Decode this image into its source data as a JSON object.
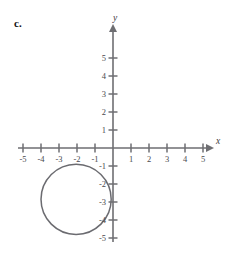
{
  "figure": {
    "part_label": "c.",
    "axis_labels": {
      "x": "x",
      "y": "y"
    },
    "x_ticks": [
      {
        "value": -5,
        "label": "-5"
      },
      {
        "value": -4,
        "label": "-4"
      },
      {
        "value": -3,
        "label": "-3"
      },
      {
        "value": -2,
        "label": "-2"
      },
      {
        "value": -1,
        "label": "-1"
      },
      {
        "value": 1,
        "label": "1"
      },
      {
        "value": 2,
        "label": "2"
      },
      {
        "value": 3,
        "label": "3"
      },
      {
        "value": 4,
        "label": "4"
      },
      {
        "value": 5,
        "label": "5"
      }
    ],
    "y_ticks": [
      {
        "value": 5,
        "label": "5"
      },
      {
        "value": 4,
        "label": "4"
      },
      {
        "value": 3,
        "label": "3"
      },
      {
        "value": 2,
        "label": "2"
      },
      {
        "value": 1,
        "label": "1"
      },
      {
        "value": -1,
        "label": "-1"
      },
      {
        "value": -2,
        "label": "-2"
      },
      {
        "value": -3,
        "label": "-3"
      },
      {
        "value": -4,
        "label": "-4"
      },
      {
        "value": -5,
        "label": "-5"
      }
    ],
    "colors": {
      "axis": "#6e6e72",
      "curve": "#6b6b70",
      "label": "#4a4a4e",
      "background": "#ffffff"
    }
  },
  "chart_data": {
    "type": "scatter",
    "title": "",
    "xlabel": "x",
    "ylabel": "y",
    "xlim": [
      -5.8,
      5.8
    ],
    "ylim": [
      -5.8,
      5.8
    ],
    "grid": false,
    "legend": "none",
    "shapes": [
      {
        "kind": "circle",
        "center_x": -2.05,
        "center_y": -2.85,
        "radius": 1.95,
        "note": "closed circular curve tangent near the y-axis on the right"
      }
    ]
  }
}
